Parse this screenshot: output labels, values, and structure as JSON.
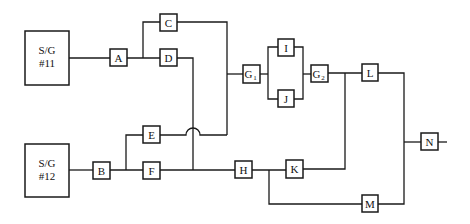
{
  "diagram": {
    "type": "reliability-block-diagram",
    "colors": {
      "line": "#1a1a1a",
      "background": "#ffffff"
    },
    "sources": [
      {
        "id": "sg11",
        "line1": "S/G",
        "line2": "#11"
      },
      {
        "id": "sg12",
        "line1": "S/G",
        "line2": "#12"
      }
    ],
    "blocks": {
      "A": "A",
      "B": "B",
      "C": "C",
      "D": "D",
      "E": "E",
      "F": "F",
      "G1": {
        "main": "G",
        "sub": "1"
      },
      "G2": {
        "main": "G",
        "sub": "2"
      },
      "H": "H",
      "I": "I",
      "J": "J",
      "K": "K",
      "L": "L",
      "M": "M",
      "N": "N"
    },
    "connections": [
      "S/G #11 -> A",
      "A -> C",
      "A -> D",
      "S/G #12 -> B",
      "B -> E",
      "B -> F",
      "C -> G1",
      "E -> G1 (crosses D line with hop)",
      "D -> H",
      "F -> H",
      "G1 -> I",
      "G1 -> J",
      "I -> G2",
      "J -> G2",
      "G2 -> L",
      "H -> K",
      "H -> M",
      "K -> (joins G2 output)",
      "L -> N",
      "M -> N"
    ]
  }
}
